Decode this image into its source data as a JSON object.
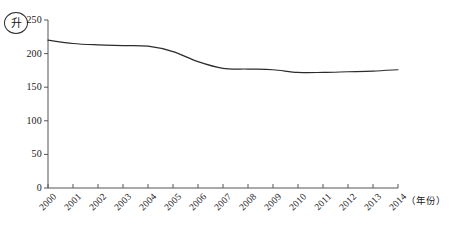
{
  "chart_data": {
    "type": "line",
    "title": "",
    "subtitle": "",
    "xlabel": "（年份）",
    "ylabel": "升",
    "ylabel_style": "circled",
    "x": [
      2000,
      2001,
      2002,
      2003,
      2004,
      2005,
      2006,
      2007,
      2008,
      2009,
      2010,
      2011,
      2012,
      2013,
      2014
    ],
    "categories": [
      "2000",
      "2001",
      "2002",
      "2003",
      "2004",
      "2005",
      "2006",
      "2007",
      "2008",
      "2009",
      "2010",
      "2011",
      "2012",
      "2013",
      "2014"
    ],
    "values": [
      220,
      215,
      213,
      212,
      211,
      203,
      188,
      178,
      177,
      176,
      172,
      172,
      173,
      174,
      176
    ],
    "series": [
      {
        "name": "人均消费量",
        "values": [
          220,
          215,
          213,
          212,
          211,
          203,
          188,
          178,
          177,
          176,
          172,
          172,
          173,
          174,
          176
        ]
      }
    ],
    "ylim": [
      0,
      250
    ],
    "yticks": [
      0,
      50,
      100,
      150,
      200,
      250
    ],
    "ytick_labels": [
      "0",
      "50",
      "100",
      "150",
      "200",
      "250"
    ],
    "xlim": [
      2000,
      2014
    ],
    "grid": false,
    "legend": false,
    "legend_position": "none",
    "markers": false,
    "line_color": "#2b2b2b",
    "axis_color": "#555555",
    "background": "#ffffff"
  },
  "axes": {
    "y_axis_name": "y-axis",
    "x_axis_name": "x-axis"
  }
}
